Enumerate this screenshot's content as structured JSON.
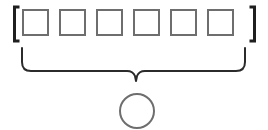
{
  "figure": {
    "title": "",
    "background_color": "#ffffff"
  },
  "sequence": {
    "name": "bracketed-sequence",
    "open_bracket": "[",
    "close_bracket": "]",
    "bracket_color": "#1f1f1f",
    "bracket_stroke_width": 3,
    "open_bracket_x": 13,
    "close_bracket_x": 253,
    "bracket_top_y": 7,
    "bracket_bottom_y": 41,
    "bracket_serif_length": 5,
    "cell_color": "#6e6e6e",
    "cell_fill": "#ffffff",
    "cell_stroke_width": 2,
    "cell_size": 25,
    "cell_top_y": 9,
    "cell_x_positions": [
      22,
      59,
      96,
      133,
      170,
      207
    ],
    "cells": [
      {
        "label": "",
        "name": "cell-1"
      },
      {
        "label": "",
        "name": "cell-2"
      },
      {
        "label": "",
        "name": "cell-3"
      },
      {
        "label": "",
        "name": "cell-4"
      },
      {
        "label": "",
        "name": "cell-5"
      },
      {
        "label": "",
        "name": "cell-6"
      }
    ]
  },
  "brace": {
    "name": "underbrace",
    "label": "",
    "color": "#2b2b2b",
    "stroke_width": 2,
    "left_x": 22,
    "right_x": 245,
    "top_y": 48,
    "arm_y": 71,
    "tip_x": 136,
    "tip_y": 81,
    "corner_radius": 9
  },
  "result": {
    "name": "result-circle",
    "label": "",
    "color": "#6e6e6e",
    "fill": "#ffffff",
    "stroke_width": 2,
    "center_x": 137,
    "center_y": 111,
    "radius": 17
  }
}
